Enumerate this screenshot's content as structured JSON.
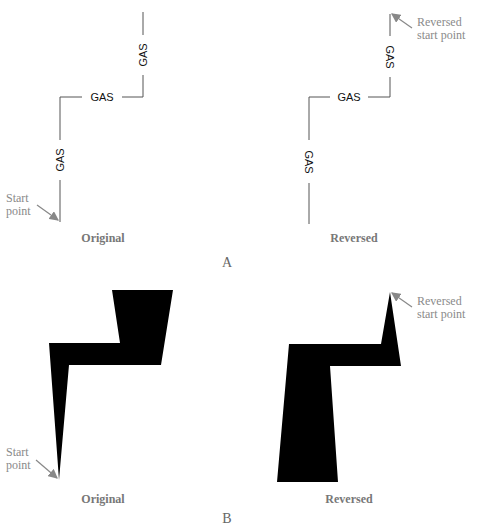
{
  "panel_a": {
    "label": "A",
    "line_label": "GAS",
    "original": {
      "caption": "Original",
      "start_note_line1": "Start",
      "start_note_line2": "point"
    },
    "reversed": {
      "caption": "Reversed",
      "start_note_line1": "Reversed",
      "start_note_line2": "start point"
    }
  },
  "panel_b": {
    "label": "B",
    "original": {
      "caption": "Original",
      "start_note_line1": "Start",
      "start_note_line2": "point"
    },
    "reversed": {
      "caption": "Reversed",
      "start_note_line1": "Reversed",
      "start_note_line2": "start point"
    }
  },
  "colors": {
    "line": "#555555",
    "arrow": "#888888",
    "fill": "#000000"
  }
}
